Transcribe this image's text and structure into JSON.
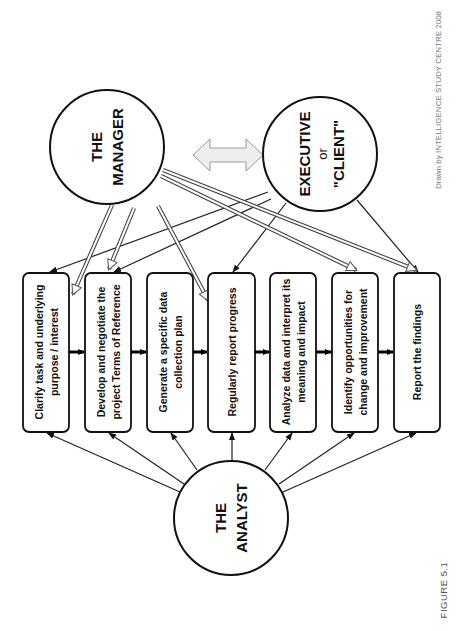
{
  "figure_label": "FIGURE 5.1",
  "credit": "Drawn by INTELLIGENCE STUDY CENTRE 2008",
  "orientation": "rotated 90 degrees counter-clockwise",
  "actors": {
    "manager": {
      "line1": "THE",
      "line2": "MANAGER"
    },
    "executive": {
      "line1": "EXECUTIVE",
      "line2": "or",
      "line3": "\"CLIENT\""
    },
    "analyst": {
      "line1": "THE",
      "line2": "ANALYST"
    }
  },
  "steps": [
    {
      "line1": "Clarify task and underlying",
      "line2": "purpose / interest"
    },
    {
      "line1": "Develop and negotiate the",
      "line2": "project Terms of Reference"
    },
    {
      "line1": "Generate a specific data",
      "line2": "collection plan"
    },
    {
      "line1": "Regularly report progress",
      "line2": ""
    },
    {
      "line1": "Analyze data and interpret its",
      "line2": "meaning and impact"
    },
    {
      "line1": "Identify opportunities for",
      "line2": "change and improvement"
    },
    {
      "line1": "Report the findings",
      "line2": ""
    }
  ],
  "connections": {
    "analyst_to_steps": [
      1,
      2,
      3,
      4,
      5,
      6,
      7
    ],
    "manager_to_steps": [
      1,
      2,
      4,
      6,
      7
    ],
    "executive_to_steps": [
      1,
      2,
      4,
      7
    ],
    "manager_executive": "two-way"
  },
  "colors": {
    "stroke": "#111111",
    "double_arrow_fill": "#eeeeee",
    "double_arrow_stroke": "#999999",
    "credit_text": "#777777"
  }
}
